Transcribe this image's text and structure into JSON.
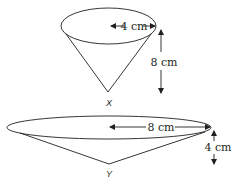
{
  "diagram": {
    "colors": {
      "stroke": "#231f20",
      "background": "#ffffff"
    },
    "cones": [
      {
        "name": "X",
        "label": "X",
        "radius_label": "4 cm",
        "height_label": "8 cm"
      },
      {
        "name": "Y",
        "label": "Y",
        "radius_label": "8 cm",
        "height_label": "4 cm"
      }
    ]
  }
}
